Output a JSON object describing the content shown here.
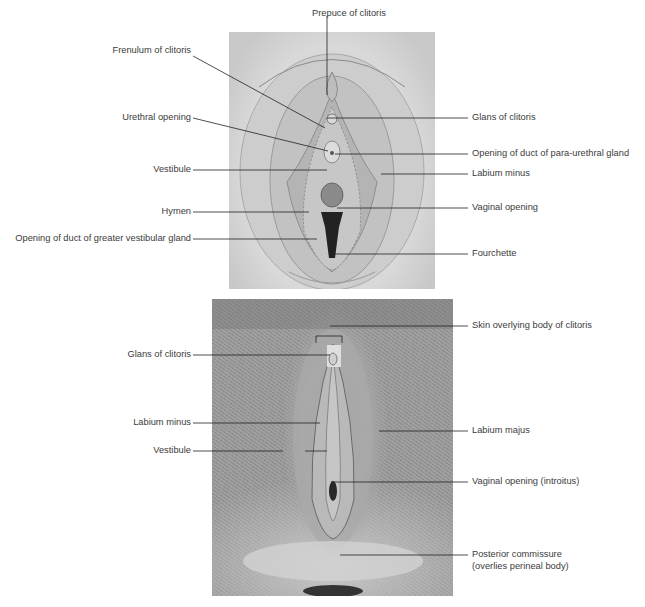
{
  "figure": {
    "top_panel": {
      "kind": "illustration",
      "labels_left": [
        {
          "text": "Frenulum of clitoris"
        },
        {
          "text": "Urethral opening"
        },
        {
          "text": "Vestibule"
        },
        {
          "text": "Hymen"
        },
        {
          "text": "Opening of duct of greater vestibular gland"
        }
      ],
      "labels_top": [
        {
          "text": "Prepuce of clitoris"
        }
      ],
      "labels_right": [
        {
          "text": "Glans of clitoris"
        },
        {
          "text": "Opening of duct of para-urethral gland"
        },
        {
          "text": "Labium minus"
        },
        {
          "text": "Vaginal opening"
        },
        {
          "text": "Fourchette"
        }
      ]
    },
    "bottom_panel": {
      "kind": "photograph",
      "labels_left": [
        {
          "text": "Glans of clitoris"
        },
        {
          "text": "Labium minus"
        },
        {
          "text": "Vestibule"
        }
      ],
      "labels_right": [
        {
          "text": "Skin overlying body of clitoris"
        },
        {
          "text": "Labium majus"
        },
        {
          "text": "Vaginal opening (introitus)"
        },
        {
          "text": "Posterior commissure",
          "line2": "(overlies perineal body)"
        }
      ]
    }
  }
}
